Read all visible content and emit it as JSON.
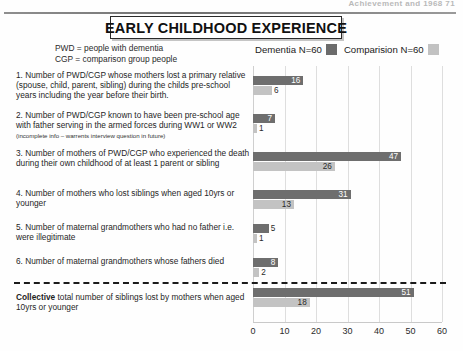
{
  "page": {
    "header_text": "Achievement and 1968   71",
    "title": "EARLY CHILDHOOD EXPERIENCE"
  },
  "key": {
    "line1": "PWD = people with dementia",
    "line2": "CGP = comparison group people"
  },
  "legend": {
    "dementia_label": "Dementia N=60",
    "comparison_label": "Comparision N=60",
    "dementia_color": "#6e6e6e",
    "comparison_color": "#c3c3c3"
  },
  "chart_data": {
    "type": "bar",
    "orientation": "horizontal",
    "title": "EARLY CHILDHOOD EXPERIENCE",
    "xlabel": "",
    "ylabel": "",
    "xlim": [
      0,
      60
    ],
    "xticks": [
      0,
      10,
      20,
      30,
      40,
      50,
      60
    ],
    "grid": true,
    "legend_position": "top-right",
    "categories": [
      "1. Number of PWD/CGP whose mothers lost a primary relative (spouse, child, parent, sibling) during the childs pre-school years including the year before their birth.",
      "2. Number of PWD/CGP known to have been pre-school age with father serving in the armed forces during WW1 or WW2",
      "3. Number of mothers of PWD/CGP who experienced the death during their own childhood of at least 1 parent or sibling",
      "4. Number of mothers who lost siblings when aged 10yrs or younger",
      "5. Number of maternal grandmothers who had no father i.e. were illegitimate",
      "6. Number of maternal grandmothers whose fathers died",
      "Collective total number of siblings lost by mothers when aged 10yrs or younger"
    ],
    "series": [
      {
        "name": "Dementia N=60",
        "values": [
          16,
          7,
          47,
          31,
          5,
          8,
          51
        ]
      },
      {
        "name": "Comparision N=60",
        "values": [
          6,
          1,
          26,
          13,
          1,
          2,
          18
        ]
      }
    ]
  },
  "items": [
    {
      "number": "1.",
      "text": "Number of PWD/CGP whose mothers lost a primary relative (spouse, child, parent, sibling) during the childs pre-school years including the year before their birth.",
      "note": "",
      "dementia": 16,
      "comparison": 6
    },
    {
      "number": "2.",
      "text": "Number of PWD/CGP known to have been pre-school age with father serving in the armed forces during WW1 or WW2",
      "note": "(incomplete info – warrents interview question in future)",
      "dementia": 7,
      "comparison": 1
    },
    {
      "number": "3.",
      "text": "Number of mothers of PWD/CGP who experienced the death during their own childhood of at least 1 parent or sibling",
      "note": "",
      "dementia": 47,
      "comparison": 26
    },
    {
      "number": "4.",
      "text": "Number of mothers who lost siblings when aged 10yrs or younger",
      "note": "",
      "dementia": 31,
      "comparison": 13
    },
    {
      "number": "5.",
      "text": "Number of maternal grandmothers who had no father i.e. were illegitimate",
      "note": "",
      "dementia": 5,
      "comparison": 1
    },
    {
      "number": "6.",
      "text": "Number of maternal grandmothers whose fathers died",
      "note": "",
      "dementia": 8,
      "comparison": 2
    }
  ],
  "collective": {
    "lead": "Collective",
    "text": " total number of siblings lost by mothers when aged 10yrs or younger",
    "dementia": 51,
    "comparison": 18
  }
}
